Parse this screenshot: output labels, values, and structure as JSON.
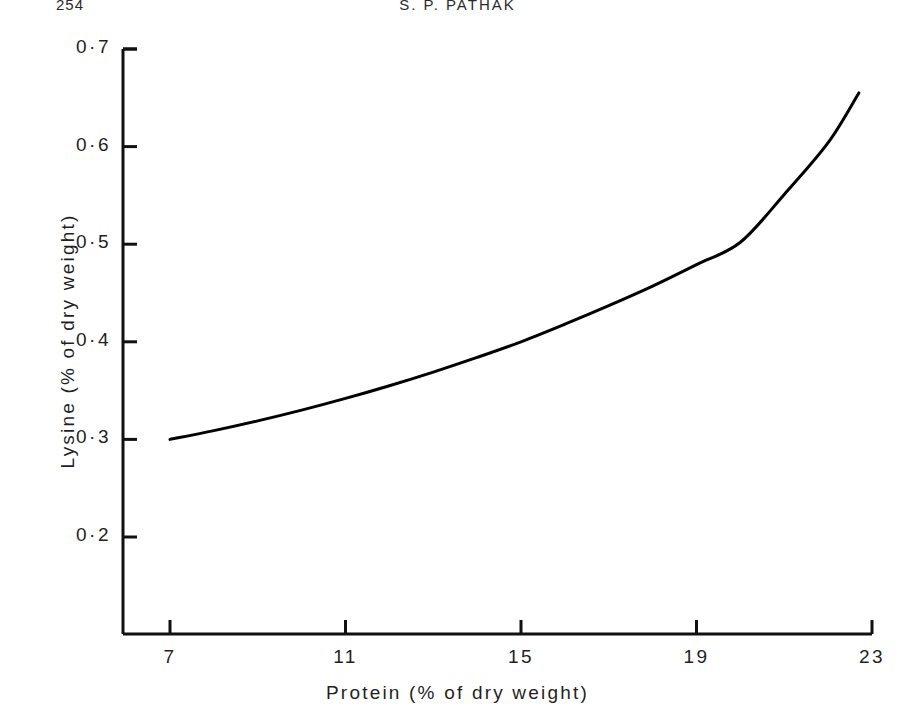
{
  "page": {
    "folio": "254",
    "running_title": "S. P. PATHAK"
  },
  "chart_data": {
    "type": "line",
    "title": "",
    "xlabel": "Protein (% of dry weight)",
    "ylabel": "Lysine (% of dry weight)",
    "xlim": [
      5.6,
      23.0
    ],
    "ylim": [
      0.155,
      0.7
    ],
    "xticks": [
      7,
      11,
      15,
      19,
      23
    ],
    "xtick_labels": [
      "7",
      "11",
      "15",
      "19",
      "23"
    ],
    "yticks": [
      0.2,
      0.3,
      0.4,
      0.5,
      0.6,
      0.7
    ],
    "ytick_labels": [
      "0·2",
      "0·3",
      "0·4",
      "0·5",
      "0·6",
      "0·7"
    ],
    "grid": false,
    "legend": false,
    "series": [
      {
        "name": "Lysine content",
        "color": "#000000",
        "line_width": 3,
        "x": [
          7.0,
          8.0,
          9.0,
          10.0,
          11.0,
          12.0,
          13.0,
          14.0,
          15.0,
          16.0,
          17.0,
          18.0,
          19.0,
          20.0,
          21.0,
          22.0,
          22.7
        ],
        "y": [
          0.3,
          0.309,
          0.319,
          0.33,
          0.342,
          0.355,
          0.369,
          0.384,
          0.4,
          0.418,
          0.437,
          0.457,
          0.479,
          0.502,
          0.551,
          0.604,
          0.655
        ]
      }
    ]
  },
  "axes": {
    "y_axis_name": "y-axis",
    "x_axis_name": "x-axis"
  }
}
